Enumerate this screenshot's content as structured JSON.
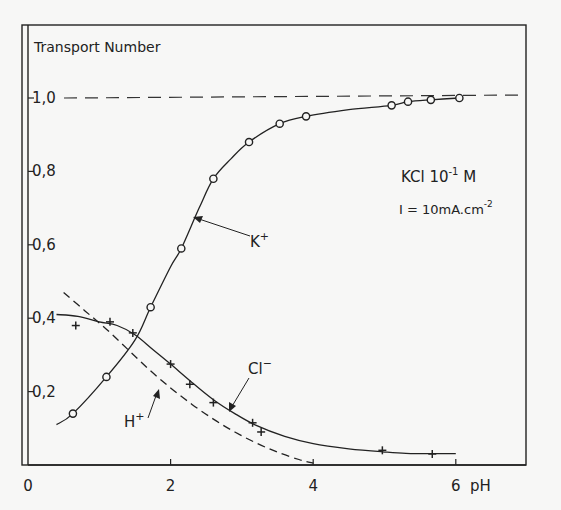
{
  "chart_data": {
    "type": "line",
    "title": "",
    "ylabel": "Transport Number",
    "xlabel": "pH",
    "xlim": [
      0,
      7.2
    ],
    "ylim": [
      0,
      1.08
    ],
    "x_ticks": [
      0,
      2,
      4,
      6
    ],
    "x_tick_labels": [
      "0",
      "2",
      "4",
      "6"
    ],
    "y_ticks": [
      0.2,
      0.4,
      0.6,
      0.8,
      1.0
    ],
    "y_tick_labels": [
      "0,2",
      "0,4",
      "0,6",
      "0,8",
      "1,0"
    ],
    "grid": false,
    "reference_line": {
      "y": 1.0,
      "style": "dashed"
    },
    "annotations": {
      "condition_line1": "KCl 10",
      "condition_line1_exp": "-1",
      "condition_line1_unit": " M",
      "condition_line2": "I = 10mA.cm",
      "condition_line2_exp": "-2"
    },
    "series": [
      {
        "name": "K+",
        "label": "K",
        "label_sup": "+",
        "marker": "circle",
        "line": "solid",
        "points": [
          [
            0.63,
            0.14
          ],
          [
            1.1,
            0.24
          ],
          [
            1.72,
            0.43
          ],
          [
            2.15,
            0.59
          ],
          [
            2.6,
            0.78
          ],
          [
            3.1,
            0.88
          ],
          [
            3.53,
            0.93
          ],
          [
            3.9,
            0.95
          ],
          [
            5.1,
            0.98
          ],
          [
            5.33,
            0.99
          ],
          [
            5.65,
            0.995
          ],
          [
            6.05,
            1.0
          ]
        ],
        "curve": [
          [
            0.4,
            0.11
          ],
          [
            0.63,
            0.14
          ],
          [
            1.1,
            0.24
          ],
          [
            1.5,
            0.34
          ],
          [
            1.72,
            0.43
          ],
          [
            2.0,
            0.54
          ],
          [
            2.15,
            0.59
          ],
          [
            2.4,
            0.7
          ],
          [
            2.6,
            0.78
          ],
          [
            2.85,
            0.835
          ],
          [
            3.1,
            0.88
          ],
          [
            3.53,
            0.93
          ],
          [
            3.9,
            0.95
          ],
          [
            4.5,
            0.968
          ],
          [
            5.1,
            0.98
          ],
          [
            5.33,
            0.99
          ],
          [
            5.65,
            0.995
          ],
          [
            6.05,
            1.0
          ]
        ]
      },
      {
        "name": "Cl-",
        "label": "Cl",
        "label_sup": "−",
        "marker": "plus",
        "line": "solid",
        "points": [
          [
            0.67,
            0.38
          ],
          [
            1.15,
            0.39
          ],
          [
            1.47,
            0.36
          ],
          [
            2.0,
            0.275
          ],
          [
            2.27,
            0.22
          ],
          [
            2.6,
            0.17
          ],
          [
            3.15,
            0.115
          ],
          [
            3.27,
            0.09
          ],
          [
            4.97,
            0.04
          ],
          [
            5.67,
            0.03
          ]
        ],
        "curve": [
          [
            0.4,
            0.41
          ],
          [
            0.7,
            0.405
          ],
          [
            1.0,
            0.39
          ],
          [
            1.25,
            0.38
          ],
          [
            1.5,
            0.355
          ],
          [
            1.75,
            0.315
          ],
          [
            2.0,
            0.275
          ],
          [
            2.3,
            0.225
          ],
          [
            2.6,
            0.178
          ],
          [
            2.9,
            0.14
          ],
          [
            3.2,
            0.108
          ],
          [
            3.6,
            0.078
          ],
          [
            4.0,
            0.058
          ],
          [
            4.5,
            0.044
          ],
          [
            4.97,
            0.036
          ],
          [
            5.3,
            0.032
          ],
          [
            5.67,
            0.031
          ],
          [
            6.0,
            0.031
          ]
        ]
      },
      {
        "name": "H+",
        "label": "H",
        "label_sup": "+",
        "marker": "none",
        "line": "dashed",
        "points": [],
        "curve": [
          [
            0.5,
            0.47
          ],
          [
            0.8,
            0.42
          ],
          [
            1.1,
            0.37
          ],
          [
            1.4,
            0.315
          ],
          [
            1.7,
            0.26
          ],
          [
            2.0,
            0.21
          ],
          [
            2.3,
            0.165
          ],
          [
            2.6,
            0.125
          ],
          [
            2.9,
            0.09
          ],
          [
            3.2,
            0.06
          ],
          [
            3.5,
            0.035
          ],
          [
            3.8,
            0.015
          ],
          [
            4.0,
            0.005
          ]
        ]
      }
    ]
  }
}
